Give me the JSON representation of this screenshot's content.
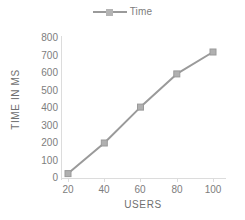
{
  "legend": {
    "position": "top-center",
    "entries": [
      {
        "label": "Time",
        "marker": "square-line-marker",
        "color": "#9a9a9a"
      }
    ]
  },
  "axes": {
    "x": {
      "title": "USERS",
      "ticks": [
        "20",
        "40",
        "60",
        "80",
        "100"
      ]
    },
    "y": {
      "title": "TIME IN MS",
      "ticks": [
        "800",
        "700",
        "600",
        "500",
        "400",
        "300",
        "200",
        "100",
        "0"
      ]
    }
  },
  "chart_data": {
    "type": "line",
    "title": "",
    "xlabel": "USERS",
    "ylabel": "TIME IN MS",
    "x": [
      20,
      40,
      60,
      80,
      100
    ],
    "categories": [
      "20",
      "40",
      "60",
      "80",
      "100"
    ],
    "series": [
      {
        "name": "Time",
        "color": "#9a9a9a",
        "marker": "square",
        "values": [
          25,
          200,
          405,
          595,
          720
        ]
      }
    ],
    "xlim": [
      10,
      110
    ],
    "ylim": [
      0,
      800
    ],
    "xticks": [
      20,
      40,
      60,
      80,
      100
    ],
    "yticks": [
      0,
      100,
      200,
      300,
      400,
      500,
      600,
      700,
      800
    ],
    "grid": false,
    "legend": true,
    "legend_position": "top-center"
  },
  "colors": {
    "series": "#9a9a9a",
    "marker": "#b0b0b0",
    "text": "#7d7d7d",
    "axis": "#dcdcdc",
    "background": "#ffffff"
  }
}
